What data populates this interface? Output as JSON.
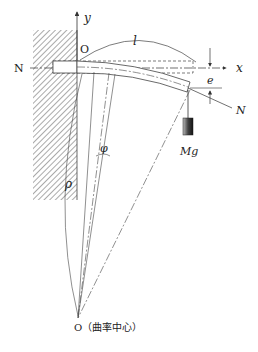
{
  "diagram": {
    "type": "cantilever beam bending diagram",
    "labels": {
      "y_axis": "y",
      "x_axis": "x",
      "origin_top": "O",
      "length": "l",
      "axial_force_left": "N",
      "axial_force_right": "N",
      "eccentricity": "e",
      "angle": "φ",
      "radius": "ρ",
      "weight": "Mg",
      "center_label": "O（曲率中心）"
    },
    "colors": {
      "line": "#333333",
      "hatch": "#555555",
      "weight_dark": "#222222",
      "weight_light": "#bbbbbb"
    }
  }
}
